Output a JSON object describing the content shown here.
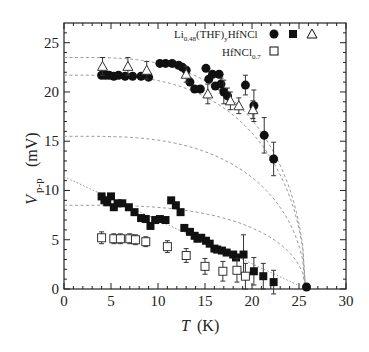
{
  "chart_data": {
    "type": "scatter",
    "title": "",
    "xlabel": "T",
    "xlabel_unit": "(K)",
    "ylabel": "V",
    "ylabel_sub": "p-p",
    "ylabel_unit": "(mV)",
    "xlim": [
      0,
      30
    ],
    "ylim": [
      0,
      27
    ],
    "xticks": [
      0,
      5,
      10,
      15,
      20,
      25,
      30
    ],
    "yticks": [
      0,
      5,
      10,
      15,
      20,
      25
    ],
    "grid": false,
    "legend": {
      "placement": "top-right",
      "entries": [
        {
          "label_main": "Li",
          "label_sub": "0.48",
          "label_rest": "(THF)",
          "label_sub2": "y",
          "label_end": "HfNCl",
          "markers": [
            "filled-circle",
            "filled-square",
            "open-triangle"
          ]
        },
        {
          "label_main": "HfNCl",
          "label_sub": "0.7",
          "markers": [
            "open-square"
          ]
        }
      ]
    },
    "series": [
      {
        "name": "Li0.48(THF)yHfNCl circle",
        "marker": "filled-circle",
        "points": [
          [
            4.0,
            21.7,
            0
          ],
          [
            4.4,
            21.7,
            0
          ],
          [
            4.8,
            21.7,
            0
          ],
          [
            5.3,
            21.6,
            0
          ],
          [
            5.8,
            21.7,
            0
          ],
          [
            6.5,
            21.6,
            0
          ],
          [
            7.3,
            21.6,
            0
          ],
          [
            8.2,
            21.6,
            0
          ],
          [
            9.0,
            21.5,
            0
          ],
          [
            10.2,
            22.9,
            0
          ],
          [
            10.8,
            22.9,
            0
          ],
          [
            11.5,
            22.9,
            0
          ],
          [
            12.2,
            22.7,
            0
          ],
          [
            12.6,
            22.5,
            0
          ],
          [
            13.0,
            22.2,
            0
          ],
          [
            13.4,
            21.0,
            0
          ],
          [
            13.9,
            20.3,
            0
          ],
          [
            14.5,
            20.3,
            0
          ],
          [
            15.1,
            22.4,
            0
          ],
          [
            15.4,
            21.3,
            0
          ],
          [
            15.8,
            21.8,
            0
          ],
          [
            16.1,
            20.6,
            0
          ],
          [
            16.5,
            21.8,
            0
          ],
          [
            16.7,
            20.8,
            0.6
          ],
          [
            17.0,
            20.0,
            1.2
          ],
          [
            17.4,
            19.6,
            0.8
          ],
          [
            19.3,
            20.7,
            1.0
          ],
          [
            20.2,
            18.6,
            1.6
          ],
          [
            21.3,
            15.6,
            1.8
          ],
          [
            22.3,
            13.2,
            1.7
          ],
          [
            25.8,
            0.2,
            0
          ]
        ]
      },
      {
        "name": "Li0.48(THF)yHfNCl square",
        "marker": "filled-square",
        "points": [
          [
            4.0,
            9.4,
            0
          ],
          [
            4.3,
            9.0,
            0
          ],
          [
            4.6,
            8.8,
            0
          ],
          [
            5.0,
            9.4,
            0
          ],
          [
            5.3,
            8.3,
            0
          ],
          [
            5.7,
            8.7,
            0
          ],
          [
            6.2,
            8.7,
            0
          ],
          [
            6.9,
            8.3,
            0
          ],
          [
            7.5,
            7.8,
            0
          ],
          [
            8.2,
            7.2,
            0
          ],
          [
            8.7,
            7.1,
            0
          ],
          [
            9.2,
            6.4,
            0
          ],
          [
            9.7,
            7.0,
            0
          ],
          [
            10.2,
            7.1,
            0
          ],
          [
            10.8,
            7.0,
            0
          ],
          [
            11.4,
            9.0,
            0
          ],
          [
            11.9,
            8.5,
            0
          ],
          [
            12.4,
            7.8,
            0
          ],
          [
            12.8,
            6.2,
            0
          ],
          [
            13.4,
            5.8,
            0
          ],
          [
            13.9,
            5.4,
            0
          ],
          [
            14.2,
            5.1,
            0
          ],
          [
            14.6,
            5.2,
            0
          ],
          [
            15.1,
            4.9,
            0
          ],
          [
            15.5,
            4.6,
            0
          ],
          [
            16.0,
            4.1,
            0
          ],
          [
            16.3,
            4.0,
            0
          ],
          [
            16.8,
            3.9,
            0
          ],
          [
            17.3,
            3.7,
            0
          ],
          [
            18.0,
            3.5,
            0
          ],
          [
            18.3,
            3.2,
            0
          ],
          [
            19.1,
            3.5,
            2.0
          ],
          [
            20.2,
            1.8,
            1.4
          ],
          [
            21.2,
            1.3,
            1.3
          ],
          [
            22.3,
            0.7,
            1.2
          ]
        ]
      },
      {
        "name": "Li0.48(THF)yHfNCl triangle",
        "marker": "open-triangle",
        "points": [
          [
            4.1,
            22.6,
            0.9
          ],
          [
            6.8,
            22.6,
            0.9
          ],
          [
            8.8,
            22.2,
            0.9
          ],
          [
            13.0,
            21.8,
            0.8
          ],
          [
            15.3,
            19.8,
            1.0
          ],
          [
            17.7,
            19.1,
            0.9
          ],
          [
            18.6,
            18.6,
            0.8
          ],
          [
            20.1,
            18.2,
            0.9
          ]
        ]
      },
      {
        "name": "HfNCl0.7",
        "marker": "open-square",
        "points": [
          [
            4.0,
            5.2,
            0.6
          ],
          [
            5.3,
            5.1,
            0.5
          ],
          [
            6.0,
            5.1,
            0.5
          ],
          [
            7.0,
            5.1,
            0.5
          ],
          [
            7.6,
            5.0,
            0.5
          ],
          [
            8.7,
            4.8,
            0.5
          ],
          [
            11.0,
            4.3,
            0.6
          ],
          [
            13.0,
            3.4,
            0.7
          ],
          [
            15.0,
            2.3,
            0.8
          ],
          [
            16.9,
            1.8,
            1.0
          ],
          [
            18.4,
            1.9,
            1.2
          ],
          [
            19.3,
            1.3,
            1.3
          ]
        ]
      }
    ],
    "fit_curves": [
      {
        "style": "dashed",
        "V0": 23.5,
        "Tc": 25.7
      },
      {
        "style": "dashed",
        "V0": 21.7,
        "Tc": 25.7
      },
      {
        "style": "dashed",
        "V0": 15.5,
        "Tc": 25.7
      },
      {
        "style": "dashed",
        "V0": 8.5,
        "Tc": 25.7
      },
      {
        "style": "dotted-line",
        "points": [
          [
            0,
            11.4
          ],
          [
            25.8,
            0
          ]
        ]
      }
    ],
    "annotations": []
  }
}
